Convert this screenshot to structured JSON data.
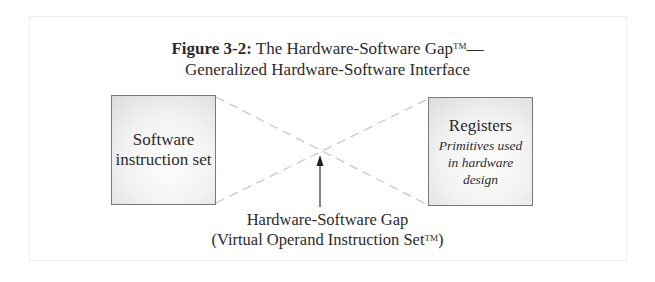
{
  "figure": {
    "title_label": "Figure 3-2:",
    "title_main": "The Hardware-Software Gap",
    "title_tm": "TM",
    "title_dash": "—",
    "subtitle": "Generalized Hardware-Software Interface"
  },
  "left_box": {
    "line1": "Software",
    "line2": "instruction set"
  },
  "right_box": {
    "title": "Registers",
    "desc_line1": "Primitives used",
    "desc_line2": "in hardware",
    "desc_line3": "design"
  },
  "gap_label": {
    "line1": "Hardware-Software Gap",
    "line2_prefix": "(Virtual Operand Instruction Set",
    "line2_tm": "TM",
    "line2_suffix": ")"
  },
  "colors": {
    "dash_line": "#c8c8c8",
    "box_border": "#7a7a7a",
    "text": "#2b2b2b",
    "arrow": "#333333"
  }
}
